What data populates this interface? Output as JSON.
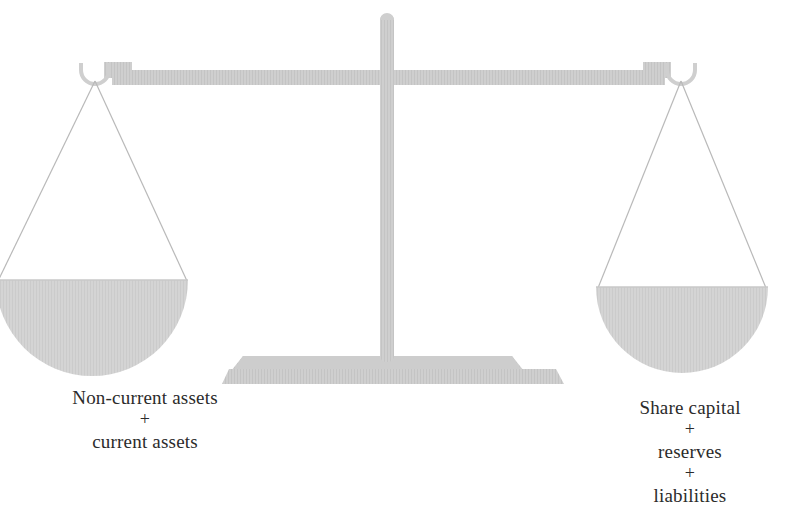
{
  "diagram": {
    "type": "balance-scale",
    "colors": {
      "beam": "#d0d0d0",
      "column": "#c9c9c9",
      "base": "#d2d2d2",
      "pan": "#d5d5d5",
      "string": "#b8b8b8",
      "text": "#2b2b2b",
      "background": "#ffffff"
    },
    "left_pan": {
      "name": "assets-pan",
      "caption_lines": [
        "Non-current assets",
        "+",
        "current assets"
      ],
      "line1": "Non-current assets",
      "plus1": "+",
      "line2": "current assets"
    },
    "right_pan": {
      "name": "equity-liabilities-pan",
      "caption_lines": [
        "Share capital",
        "+",
        "reserves",
        "+",
        "liabilities"
      ],
      "line1": "Share capital",
      "plus1": "+",
      "line2": "reserves",
      "plus2": "+",
      "line3": "liabilities"
    },
    "parts": {
      "beam": "beam",
      "column": "column",
      "base": "base",
      "left_hook": "left-hook",
      "right_hook": "right-hook",
      "left_strings": "left-strings",
      "right_strings": "right-strings"
    }
  }
}
